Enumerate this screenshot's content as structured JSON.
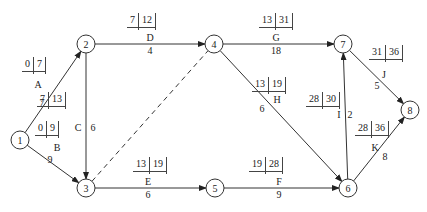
{
  "diagram": {
    "type": "activity-on-arrow network",
    "nodes": [
      {
        "id": "1",
        "x": 20,
        "y": 140
      },
      {
        "id": "2",
        "x": 86,
        "y": 44
      },
      {
        "id": "3",
        "x": 86,
        "y": 188
      },
      {
        "id": "4",
        "x": 214,
        "y": 44
      },
      {
        "id": "5",
        "x": 215,
        "y": 188
      },
      {
        "id": "6",
        "x": 348,
        "y": 188
      },
      {
        "id": "7",
        "x": 343,
        "y": 44
      },
      {
        "id": "8",
        "x": 410,
        "y": 110
      }
    ],
    "activities": [
      {
        "name": "A",
        "from": "1",
        "to": "2",
        "duration": "7",
        "es": "0",
        "ef": "7"
      },
      {
        "name": "B",
        "from": "1",
        "to": "3",
        "duration": "9",
        "es": "0",
        "ef": "9"
      },
      {
        "name": "C",
        "from": "2",
        "to": "3",
        "duration": "6",
        "es": "7",
        "ef": "13"
      },
      {
        "name": "D",
        "from": "2",
        "to": "4",
        "duration": "4",
        "es": "7",
        "ef": "12"
      },
      {
        "name": "dummy",
        "from": "3",
        "to": "4",
        "duration": "",
        "es": "",
        "ef": ""
      },
      {
        "name": "E",
        "from": "3",
        "to": "5",
        "duration": "6",
        "es": "13",
        "ef": "19"
      },
      {
        "name": "F",
        "from": "5",
        "to": "6",
        "duration": "9",
        "es": "19",
        "ef": "28"
      },
      {
        "name": "G",
        "from": "4",
        "to": "7",
        "duration": "18",
        "es": "13",
        "ef": "31"
      },
      {
        "name": "H",
        "from": "4",
        "to": "6",
        "duration": "6",
        "es": "13",
        "ef": "19"
      },
      {
        "name": "I",
        "from": "6",
        "to": "7",
        "duration": "2",
        "es": "28",
        "ef": "30"
      },
      {
        "name": "J",
        "from": "7",
        "to": "8",
        "duration": "5",
        "es": "31",
        "ef": "36"
      },
      {
        "name": "K",
        "from": "6",
        "to": "8",
        "duration": "8",
        "es": "28",
        "ef": "36"
      }
    ]
  }
}
